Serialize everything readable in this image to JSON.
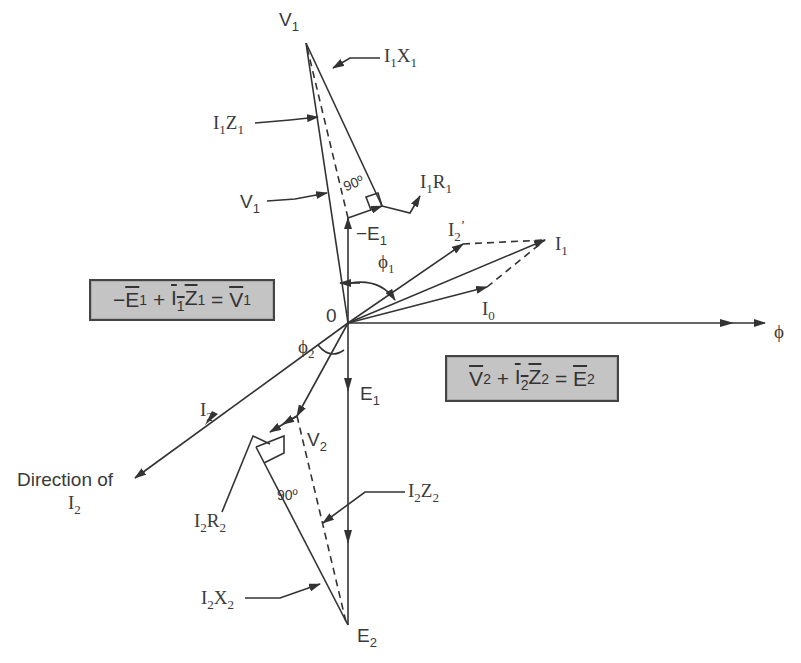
{
  "diagram": {
    "origin_label": "0",
    "flux_label": "ϕ",
    "equations": {
      "primary": {
        "lhs1": "E",
        "lhs1_sub": "1",
        "lhs2": "I",
        "lhs2_sub": "1",
        "lhs3": "Z",
        "lhs3_sub": "1",
        "rhs": "V",
        "rhs_sub": "1",
        "text": "−E1 + I1Z1 = V1"
      },
      "secondary": {
        "lhs1": "V",
        "lhs1_sub": "2",
        "lhs2": "I",
        "lhs2_sub": "2",
        "lhs3": "Z",
        "lhs3_sub": "2",
        "rhs": "E",
        "rhs_sub": "2",
        "text": "V2 + I2Z2 = E2"
      }
    },
    "labels": {
      "V1_top": {
        "main": "V",
        "sub": "1"
      },
      "I1X1": {
        "a": "I",
        "a_sub": "1",
        "b": "X",
        "b_sub": "1"
      },
      "I1Z1": {
        "a": "I",
        "a_sub": "1",
        "b": "Z",
        "b_sub": "1"
      },
      "V1_side": {
        "main": "V",
        "sub": "1"
      },
      "I1R1": {
        "a": "I",
        "a_sub": "1",
        "b": "R",
        "b_sub": "1"
      },
      "angle_90_top": "90º",
      "minus_E1": {
        "main": "−E",
        "sub": "1"
      },
      "I2_prime": {
        "main": "I",
        "sub": "2",
        "sup": "’"
      },
      "I1": {
        "main": "I",
        "sub": "1"
      },
      "phi1": {
        "main": "ϕ",
        "sub": "1"
      },
      "I0": {
        "main": "I",
        "sub": "0"
      },
      "phi2": {
        "main": "ϕ",
        "sub": "2"
      },
      "E1": {
        "main": "E",
        "sub": "1"
      },
      "I2": {
        "main": "I",
        "sub": "2"
      },
      "V2": {
        "main": "V",
        "sub": "2"
      },
      "direction_of": "Direction of",
      "direction_I2": {
        "main": "I",
        "sub": "2"
      },
      "angle_90_bottom": "90º",
      "I2Z2": {
        "a": "I",
        "a_sub": "2",
        "b": "Z",
        "b_sub": "2"
      },
      "I2R2": {
        "a": "I",
        "a_sub": "2",
        "b": "R",
        "b_sub": "2"
      },
      "I2X2": {
        "a": "I",
        "a_sub": "2",
        "b": "X",
        "b_sub": "2"
      },
      "E2": {
        "main": "E",
        "sub": "2"
      }
    },
    "colors": {
      "line": "#333333",
      "box_fill": "#c4c4c4",
      "text": "#3a3a3a"
    }
  }
}
